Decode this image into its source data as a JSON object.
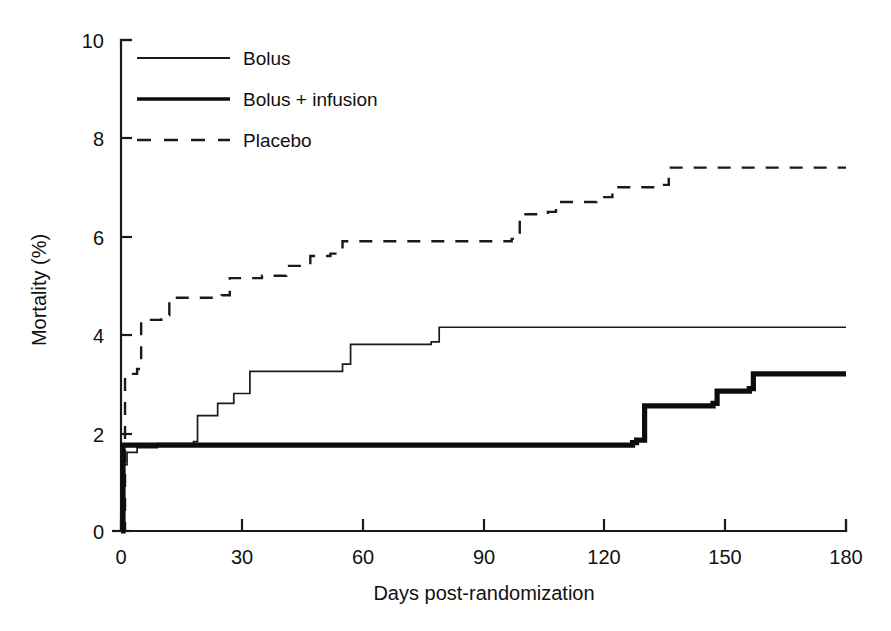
{
  "chart_data": {
    "type": "line",
    "title": "",
    "xlabel": "Days post-randomization",
    "ylabel": "Mortality (%)",
    "xlim": [
      0,
      180
    ],
    "ylim": [
      0,
      10
    ],
    "xticks": [
      0,
      30,
      60,
      90,
      120,
      150,
      180
    ],
    "yticks": [
      0,
      2,
      4,
      6,
      8,
      10
    ],
    "xtick_labels": [
      "0",
      "30",
      "60",
      "90",
      "120",
      "150",
      "180"
    ],
    "ytick_labels": [
      "0",
      "2",
      "4",
      "6",
      "8",
      "10"
    ],
    "grid": false,
    "legend_position": "top-left",
    "step_style": "post",
    "series": [
      {
        "name": "Bolus",
        "style": "thin-solid",
        "color": "#1a1a1a",
        "points": [
          [
            0,
            0.0
          ],
          [
            0.5,
            1.35
          ],
          [
            1.5,
            1.6
          ],
          [
            4,
            1.7
          ],
          [
            9,
            1.78
          ],
          [
            18,
            1.82
          ],
          [
            19,
            2.35
          ],
          [
            24,
            2.6
          ],
          [
            28,
            2.8
          ],
          [
            32,
            3.25
          ],
          [
            55,
            3.4
          ],
          [
            57,
            3.8
          ],
          [
            77,
            3.85
          ],
          [
            79,
            4.15
          ],
          [
            180,
            4.15
          ]
        ]
      },
      {
        "name": "Bolus + infusion",
        "style": "thick-solid",
        "color": "#0d0d0d",
        "points": [
          [
            0,
            0.0
          ],
          [
            0.5,
            1.75
          ],
          [
            127,
            1.8
          ],
          [
            128,
            1.85
          ],
          [
            130,
            2.55
          ],
          [
            147,
            2.6
          ],
          [
            148,
            2.85
          ],
          [
            156,
            2.9
          ],
          [
            157,
            3.2
          ],
          [
            180,
            3.2
          ]
        ]
      },
      {
        "name": "Placebo",
        "style": "dashed",
        "color": "#1a1a1a",
        "points": [
          [
            0,
            0.0
          ],
          [
            1,
            3.2
          ],
          [
            4,
            3.3
          ],
          [
            5,
            4.3
          ],
          [
            10,
            4.4
          ],
          [
            12,
            4.75
          ],
          [
            25,
            4.8
          ],
          [
            27,
            5.15
          ],
          [
            35,
            5.2
          ],
          [
            41,
            5.4
          ],
          [
            47,
            5.6
          ],
          [
            52,
            5.65
          ],
          [
            55,
            5.9
          ],
          [
            97,
            5.95
          ],
          [
            99,
            6.45
          ],
          [
            106,
            6.5
          ],
          [
            108,
            6.7
          ],
          [
            118,
            6.8
          ],
          [
            122,
            7.0
          ],
          [
            133,
            7.05
          ],
          [
            136,
            7.4
          ],
          [
            180,
            7.4
          ]
        ]
      }
    ],
    "legend": [
      {
        "label": "Bolus",
        "style": "thin-solid"
      },
      {
        "label": "Bolus + infusion",
        "style": "thick-solid"
      },
      {
        "label": "Placebo",
        "style": "dashed"
      }
    ]
  },
  "axes": {
    "x_label": "Days post-randomization",
    "y_label": "Mortality (%)"
  }
}
